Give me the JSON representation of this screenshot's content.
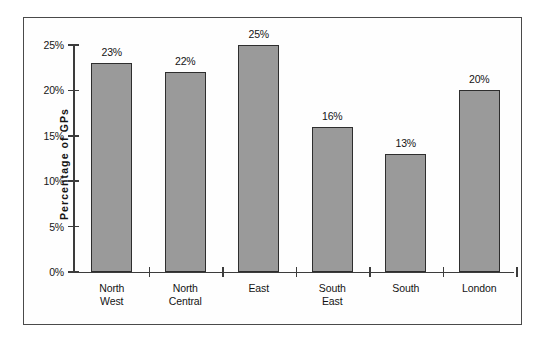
{
  "chart_data": {
    "type": "bar",
    "title": "",
    "xlabel": "",
    "ylabel": "Percentage  of  GPs",
    "categories": [
      "North West",
      "North Central",
      "East",
      "South East",
      "South",
      "London"
    ],
    "category_lines": [
      [
        "North",
        "West"
      ],
      [
        "North",
        "Central"
      ],
      [
        "East",
        ""
      ],
      [
        "South",
        "East"
      ],
      [
        "South",
        ""
      ],
      [
        "London",
        ""
      ]
    ],
    "values": [
      23,
      22,
      25,
      16,
      13,
      20
    ],
    "data_labels": [
      "23%",
      "22%",
      "25%",
      "16%",
      "13%",
      "20%"
    ],
    "ylim": [
      0,
      25
    ],
    "ytick_values": [
      0,
      5,
      10,
      15,
      20,
      25
    ],
    "ytick_labels": [
      "0%",
      "5%",
      "10%",
      "15%",
      "20%",
      "25%"
    ],
    "grid": false,
    "legend": null,
    "legend_position": "none",
    "bar_fill_color": "#9a9a9a",
    "bar_border_color": "#2e2e2e",
    "axis_color": "#3c3c3c",
    "frame_color": "#4a4a4a",
    "background_color": "#ffffff"
  }
}
